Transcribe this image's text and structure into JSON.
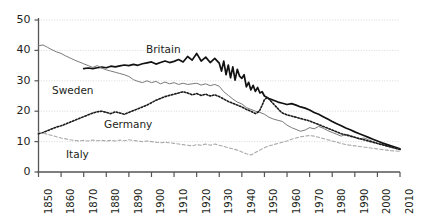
{
  "chart_data": {
    "type": "line",
    "title": "",
    "xlabel": "",
    "ylabel": "",
    "xlim": [
      1850,
      2010
    ],
    "ylim": [
      0,
      50
    ],
    "grid": true,
    "legend_position": "inline-labels",
    "y_ticks": [
      "0",
      "10",
      "20",
      "30",
      "40",
      "50"
    ],
    "y_tick_values": [
      0,
      10,
      20,
      30,
      40,
      50
    ],
    "x_ticks": [
      "1850",
      "1860",
      "1870",
      "1880",
      "1890",
      "1900",
      "1910",
      "1920",
      "1930",
      "1940",
      "1950",
      "1960",
      "1970",
      "1980",
      "1990",
      "2000",
      "2010"
    ],
    "x_tick_values": [
      1850,
      1860,
      1870,
      1880,
      1890,
      1900,
      1910,
      1920,
      1930,
      1940,
      1950,
      1960,
      1970,
      1980,
      1990,
      2000,
      2010
    ],
    "series": [
      {
        "name": "Britain",
        "style": "solid-thick-black",
        "color": "#111111",
        "label_position": {
          "x": 146,
          "y": 43
        },
        "x": [
          1870,
          1872,
          1874,
          1876,
          1878,
          1880,
          1882,
          1884,
          1886,
          1888,
          1890,
          1892,
          1894,
          1896,
          1898,
          1900,
          1902,
          1904,
          1906,
          1908,
          1910,
          1912,
          1914,
          1916,
          1918,
          1920,
          1922,
          1924,
          1926,
          1928,
          1930,
          1931,
          1932,
          1933,
          1934,
          1935,
          1936,
          1937,
          1938,
          1939,
          1940,
          1941,
          1942,
          1943,
          1944,
          1945,
          1946,
          1947,
          1948,
          1949,
          1950,
          1952,
          1954,
          1956,
          1958,
          1960,
          1962,
          1964,
          1966,
          1968,
          1970,
          1972,
          1974,
          1976,
          1978,
          1980,
          1982,
          1984,
          1986,
          1988,
          1990,
          1992,
          1994,
          1996,
          1998,
          2000,
          2002,
          2004,
          2006,
          2008,
          2010
        ],
        "y": [
          34.0,
          34.2,
          34.0,
          34.3,
          34.5,
          34.3,
          34.8,
          34.6,
          34.9,
          35.2,
          35.0,
          35.4,
          35.1,
          35.6,
          35.9,
          36.2,
          35.5,
          36.0,
          36.5,
          36.0,
          36.4,
          37.0,
          36.2,
          38.0,
          36.8,
          39.0,
          36.5,
          37.8,
          36.0,
          37.4,
          35.8,
          33.2,
          36.5,
          32.0,
          35.2,
          31.0,
          34.6,
          30.2,
          33.8,
          31.5,
          30.8,
          32.0,
          28.0,
          29.5,
          27.0,
          28.5,
          26.5,
          27.8,
          26.0,
          26.4,
          25.0,
          24.2,
          23.6,
          23.0,
          22.6,
          22.2,
          22.5,
          22.0,
          21.4,
          21.0,
          20.4,
          19.6,
          19.0,
          18.2,
          17.4,
          16.6,
          15.9,
          15.2,
          14.5,
          13.9,
          13.2,
          12.6,
          12.0,
          11.4,
          10.8,
          10.2,
          9.6,
          9.1,
          8.6,
          8.1,
          7.6
        ]
      },
      {
        "name": "Sweden",
        "style": "solid-thin-gray",
        "color": "#7a7a7a",
        "label_position": {
          "x": 52,
          "y": 84
        },
        "x": [
          1850,
          1852,
          1854,
          1856,
          1858,
          1860,
          1862,
          1864,
          1866,
          1868,
          1870,
          1872,
          1874,
          1876,
          1878,
          1880,
          1882,
          1884,
          1886,
          1888,
          1890,
          1892,
          1894,
          1896,
          1898,
          1900,
          1902,
          1904,
          1906,
          1908,
          1910,
          1912,
          1914,
          1916,
          1918,
          1920,
          1922,
          1924,
          1926,
          1928,
          1930,
          1932,
          1934,
          1936,
          1938,
          1940,
          1942,
          1944,
          1946,
          1948,
          1950,
          1952,
          1954,
          1956,
          1958,
          1960,
          1962,
          1964,
          1966,
          1968,
          1970,
          1972,
          1974,
          1976,
          1978,
          1980,
          1982,
          1984,
          1986,
          1988,
          1990,
          1992,
          1994,
          1996,
          1998,
          2000,
          2002,
          2004,
          2006,
          2008,
          2010
        ],
        "y": [
          41.5,
          41.8,
          41.0,
          40.2,
          39.5,
          39.0,
          38.2,
          37.5,
          36.8,
          36.2,
          35.6,
          35.0,
          34.4,
          35.0,
          34.2,
          33.6,
          33.2,
          32.8,
          32.4,
          32.0,
          31.4,
          30.4,
          29.8,
          29.4,
          30.0,
          29.4,
          29.8,
          29.0,
          29.6,
          29.0,
          29.4,
          28.8,
          29.2,
          28.8,
          29.0,
          29.2,
          28.6,
          29.0,
          28.4,
          28.8,
          28.2,
          26.4,
          25.2,
          24.0,
          23.0,
          22.4,
          21.2,
          20.6,
          20.0,
          19.6,
          19.0,
          18.0,
          17.4,
          17.0,
          16.6,
          15.4,
          14.6,
          14.0,
          13.4,
          13.8,
          14.6,
          14.2,
          15.0,
          14.4,
          13.6,
          13.0,
          12.4,
          11.8,
          12.4,
          12.0,
          11.4,
          10.8,
          11.2,
          10.6,
          10.0,
          9.4,
          9.0,
          8.6,
          8.2,
          7.8,
          7.4
        ]
      },
      {
        "name": "Germany",
        "style": "dotted-black",
        "color": "#1a1a1a",
        "label_position": {
          "x": 104,
          "y": 118
        },
        "x": [
          1850,
          1852,
          1854,
          1856,
          1858,
          1860,
          1862,
          1864,
          1866,
          1868,
          1870,
          1872,
          1874,
          1876,
          1878,
          1880,
          1882,
          1884,
          1886,
          1888,
          1890,
          1892,
          1894,
          1896,
          1898,
          1900,
          1902,
          1904,
          1906,
          1908,
          1910,
          1912,
          1914,
          1916,
          1918,
          1920,
          1922,
          1924,
          1926,
          1928,
          1930,
          1932,
          1934,
          1936,
          1938,
          1940,
          1942,
          1944,
          1946,
          1947,
          1948,
          1949,
          1950,
          1951,
          1952,
          1953,
          1954,
          1955,
          1956,
          1957,
          1958,
          1960,
          1962,
          1964,
          1966,
          1968,
          1970,
          1972,
          1974,
          1976,
          1978,
          1980,
          1982,
          1984,
          1986,
          1988,
          1990,
          1992,
          1994,
          1996,
          1998,
          2000,
          2002,
          2004,
          2006,
          2008,
          2010
        ],
        "y": [
          12.6,
          13.0,
          13.6,
          14.2,
          14.8,
          15.2,
          15.8,
          16.4,
          17.0,
          17.6,
          18.2,
          18.8,
          19.4,
          19.8,
          20.0,
          19.6,
          19.2,
          19.8,
          19.4,
          19.0,
          19.6,
          20.2,
          20.8,
          21.4,
          22.0,
          22.8,
          23.6,
          24.2,
          24.8,
          25.2,
          25.6,
          26.0,
          26.4,
          26.0,
          25.4,
          25.8,
          25.2,
          25.6,
          25.0,
          25.4,
          24.8,
          24.0,
          23.2,
          22.6,
          22.0,
          21.4,
          20.6,
          20.0,
          19.2,
          19.6,
          20.4,
          22.0,
          23.8,
          24.4,
          24.0,
          23.2,
          22.4,
          21.6,
          20.8,
          20.0,
          19.4,
          18.8,
          18.4,
          18.0,
          17.6,
          17.2,
          16.8,
          16.2,
          15.6,
          15.0,
          14.4,
          13.8,
          13.2,
          12.6,
          12.2,
          11.8,
          11.4,
          11.0,
          10.6,
          10.2,
          9.8,
          9.4,
          9.0,
          8.6,
          8.2,
          7.8,
          7.4
        ]
      },
      {
        "name": "Italy",
        "style": "dashed-lightgray",
        "color": "#a9a9a9",
        "label_position": {
          "x": 66,
          "y": 148
        },
        "x": [
          1850,
          1852,
          1854,
          1856,
          1858,
          1860,
          1862,
          1864,
          1866,
          1868,
          1870,
          1872,
          1874,
          1876,
          1878,
          1880,
          1882,
          1884,
          1886,
          1888,
          1890,
          1892,
          1894,
          1896,
          1898,
          1900,
          1902,
          1904,
          1906,
          1908,
          1910,
          1912,
          1914,
          1916,
          1918,
          1920,
          1922,
          1924,
          1926,
          1928,
          1930,
          1932,
          1934,
          1936,
          1938,
          1940,
          1942,
          1944,
          1946,
          1948,
          1950,
          1952,
          1954,
          1956,
          1958,
          1960,
          1962,
          1964,
          1966,
          1968,
          1970,
          1972,
          1974,
          1976,
          1978,
          1980,
          1982,
          1984,
          1986,
          1988,
          1990,
          1992,
          1994,
          1996,
          1998,
          2000,
          2002,
          2004,
          2006,
          2008,
          2010
        ],
        "y": [
          13.2,
          12.8,
          12.4,
          12.0,
          11.6,
          11.2,
          10.9,
          10.6,
          10.4,
          10.2,
          10.4,
          10.2,
          10.5,
          10.3,
          10.4,
          10.2,
          10.4,
          10.2,
          10.5,
          10.3,
          10.6,
          10.4,
          10.2,
          10.0,
          10.2,
          10.0,
          9.8,
          9.6,
          9.8,
          9.6,
          9.4,
          9.2,
          9.0,
          8.8,
          8.6,
          9.0,
          8.8,
          9.2,
          8.8,
          9.2,
          8.8,
          8.4,
          8.0,
          7.6,
          7.2,
          6.6,
          6.0,
          5.6,
          6.4,
          7.2,
          8.0,
          8.6,
          9.0,
          9.4,
          9.8,
          10.2,
          10.8,
          11.2,
          11.6,
          11.8,
          12.0,
          11.8,
          11.4,
          11.0,
          10.6,
          10.2,
          9.8,
          9.4,
          9.0,
          8.8,
          8.6,
          8.4,
          8.2,
          8.0,
          7.8,
          7.6,
          7.4,
          7.2,
          7.0,
          6.9,
          6.8
        ]
      }
    ]
  }
}
